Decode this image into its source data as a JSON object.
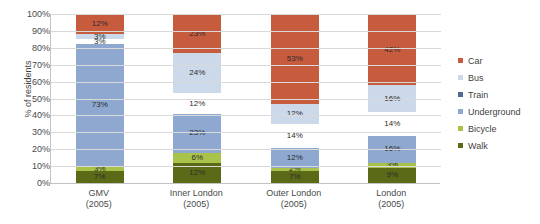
{
  "chart_data": {
    "type": "bar",
    "stacked": true,
    "title": "",
    "xlabel": "",
    "ylabel": "% of residents",
    "ylim": [
      0,
      100
    ],
    "grid": true,
    "legend_position": "right",
    "categories": [
      "GMV",
      "Inner London",
      "Outer London",
      "London"
    ],
    "category_sublabels": [
      "(2005)",
      "(2005)",
      "(2005)",
      "(2005)"
    ],
    "ytick_labels": [
      "0%",
      "10%",
      "20%",
      "30%",
      "40%",
      "50%",
      "60%",
      "70%",
      "80%",
      "90%",
      "100%"
    ],
    "ytick_values": [
      0,
      10,
      20,
      30,
      40,
      50,
      60,
      70,
      80,
      90,
      100
    ],
    "series": [
      {
        "name": "Walk",
        "color": "#5a6a17",
        "values": [
          7,
          12,
          7,
          9
        ],
        "labels": [
          "7%",
          "12%",
          "7%",
          "9%"
        ]
      },
      {
        "name": "Bicycle",
        "color": "#a8c24a",
        "values": [
          3,
          6,
          2,
          3
        ],
        "labels": [
          "3%",
          "6%",
          "2%",
          "3%"
        ]
      },
      {
        "name": "Underground",
        "color": "#8fa8d0",
        "values": [
          73,
          23,
          12,
          16
        ],
        "labels": [
          "73%",
          "23%",
          "12%",
          "16%"
        ]
      },
      {
        "name": "Train",
        "color": "#4f6party",
        "values": [
          3,
          12,
          14,
          14
        ],
        "labels": [
          "3%",
          "12%",
          "14%",
          "14%"
        ]
      },
      {
        "name": "Bus",
        "color": "#ccd9ea",
        "values": [
          3,
          24,
          12,
          16
        ],
        "labels": [
          "3%",
          "24%",
          "12%",
          "16%"
        ]
      },
      {
        "name": "Car",
        "color": "#c75b3e",
        "values": [
          12,
          23,
          53,
          42
        ],
        "labels": [
          "12%",
          "23%",
          "53%",
          "42%"
        ]
      }
    ]
  },
  "legend": {
    "items": [
      {
        "label": "Car",
        "color": "#c75b3e"
      },
      {
        "label": "Bus",
        "color": "#ccd9ea"
      },
      {
        "label": "Train",
        "color": "#4f6a94"
      },
      {
        "label": "Underground",
        "color": "#8fa8d0"
      },
      {
        "label": "Bicycle",
        "color": "#a8c24a"
      },
      {
        "label": "Walk",
        "color": "#5a6a17"
      }
    ]
  }
}
